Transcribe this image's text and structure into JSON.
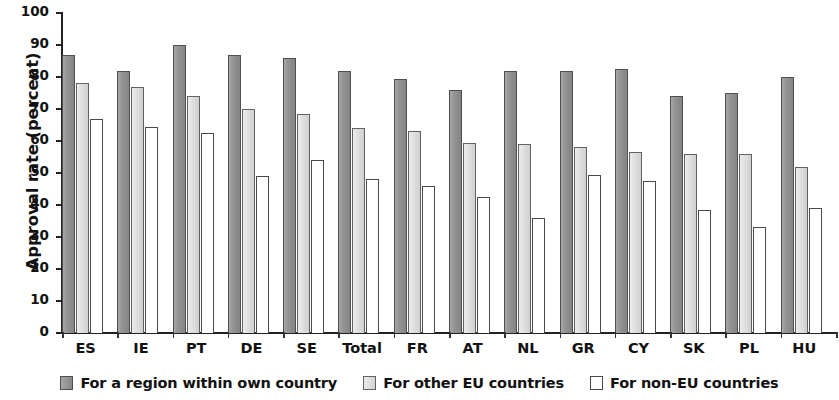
{
  "chart_data": {
    "type": "bar",
    "title": "",
    "xlabel": "",
    "ylabel": "Approval rate (percent)",
    "ylim": [
      0,
      100
    ],
    "yticks": [
      0,
      10,
      20,
      30,
      40,
      50,
      60,
      70,
      80,
      90,
      100
    ],
    "ytick_labels": [
      "0",
      "10",
      "20",
      "30",
      "40",
      "50",
      "60",
      "70",
      "80",
      "90",
      "100"
    ],
    "grid": false,
    "legend_position": "bottom",
    "categories": [
      "ES",
      "IE",
      "PT",
      "DE",
      "SE",
      "Total",
      "FR",
      "AT",
      "NL",
      "GR",
      "CY",
      "SK",
      "PL",
      "HU"
    ],
    "series": [
      {
        "name": "For a region within own country",
        "color": "#8f8f8f",
        "values": [
          87,
          82,
          90,
          87,
          86,
          82,
          79.5,
          76,
          82,
          82,
          82.5,
          74,
          75,
          80
        ]
      },
      {
        "name": "For other EU countries",
        "color": "#dcdcdc",
        "values": [
          78,
          77,
          74,
          70,
          68.5,
          64,
          63,
          59.5,
          59,
          58,
          56.5,
          56,
          56,
          52
        ]
      },
      {
        "name": "For non-EU countries",
        "color": "#ffffff",
        "values": [
          67,
          64.5,
          62.5,
          49,
          54,
          48,
          46,
          42.5,
          36,
          49.5,
          47.5,
          38.5,
          33,
          39
        ]
      }
    ]
  }
}
